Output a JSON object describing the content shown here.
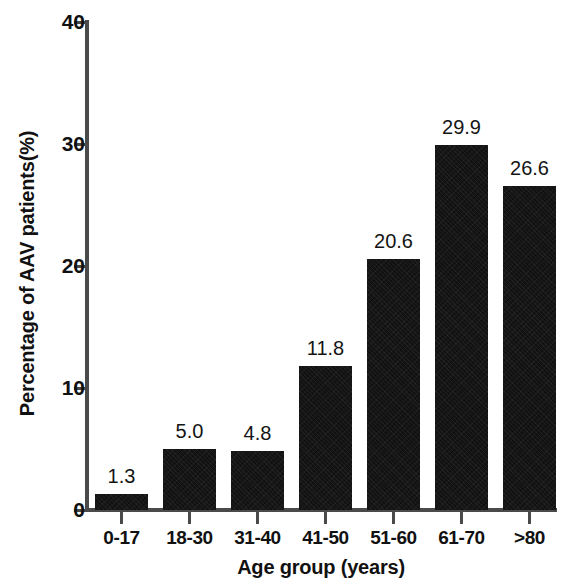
{
  "chart_data": {
    "type": "bar",
    "title": "",
    "xlabel": "Age group (years)",
    "ylabel": "Percentage of AAV patients(%)",
    "categories": [
      "0-17",
      "18-30",
      "31-40",
      "41-50",
      "51-60",
      "61-70",
      ">80"
    ],
    "values": [
      1.3,
      5.0,
      4.8,
      11.8,
      20.6,
      29.9,
      26.6
    ],
    "value_labels": [
      "1.3",
      "5.0",
      "4.8",
      "11.8",
      "20.6",
      "29.9",
      "26.6"
    ],
    "ylim": [
      0,
      40
    ],
    "ytick_labels": [
      "0",
      "10",
      "20",
      "30",
      "40"
    ],
    "ytick_values": [
      0,
      10,
      20,
      30,
      40
    ],
    "grid": false,
    "legend": false,
    "bar_color": "#121212",
    "axis_color": "#4a4a4a",
    "background_color": "#ffffff"
  }
}
